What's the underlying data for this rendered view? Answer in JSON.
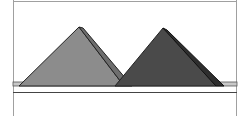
{
  "diagram": {
    "colors": {
      "background": "#ffffff",
      "frame": "#9a9a9a",
      "left_pyramid_face": "#8c8c8c",
      "left_pyramid_side": "#6e6e6e",
      "right_pyramid_face": "#4a4a4a",
      "right_pyramid_side": "#2e2e2e",
      "ground_strip": "#c8c8c8",
      "outline": "#222222"
    },
    "shapes": [
      {
        "name": "left-pyramid",
        "peak": [
          79,
          27
        ],
        "base_left": [
          19,
          85
        ],
        "base_right": [
          132,
          85
        ]
      },
      {
        "name": "right-pyramid",
        "peak": [
          163,
          28
        ],
        "base_left": [
          115,
          85
        ],
        "base_right": [
          224,
          85
        ]
      }
    ]
  }
}
